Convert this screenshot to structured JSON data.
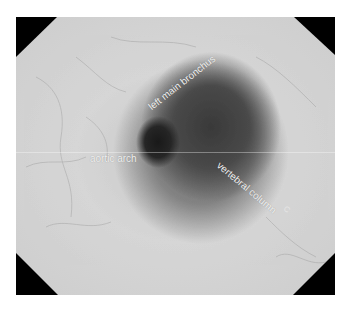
{
  "image": {
    "description": "Endoscopic (esophagoscopy) grayscale view of esophageal lumen with anatomical labels",
    "labels": {
      "left_main_bronchus": "left main bronchus",
      "aortic_arch": "aortic arch",
      "vertebral_column": "vertebral column",
      "mark": "C"
    }
  }
}
